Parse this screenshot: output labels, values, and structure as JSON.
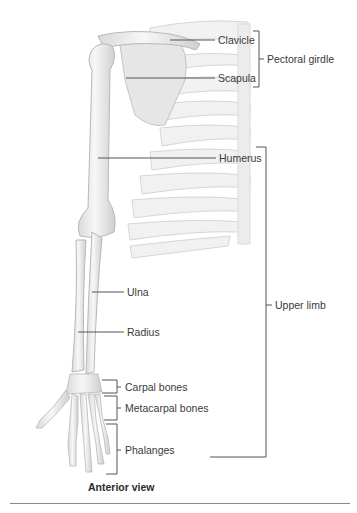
{
  "figure": {
    "caption": "Anterior view",
    "labels": {
      "clavicle": "Clavicle",
      "scapula": "Scapula",
      "pectoral_girdle": "Pectoral girdle",
      "humerus": "Humerus",
      "ulna": "Ulna",
      "radius": "Radius",
      "upper_limb": "Upper limb",
      "carpal_bones": "Carpal bones",
      "metacarpal_bones": "Metacarpal bones",
      "phalanges": "Phalanges"
    },
    "colors": {
      "leader_line": "#555555",
      "bone_fill": "#ececec",
      "bone_stroke": "#bdbdbd",
      "rib_fill": "#f2f2f2",
      "rule": "#8a8a8a"
    }
  }
}
